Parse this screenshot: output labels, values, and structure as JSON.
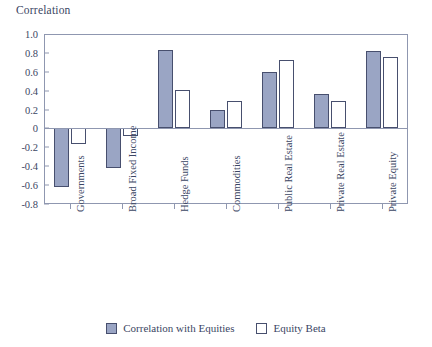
{
  "chart_data": {
    "type": "bar",
    "title": "Correlation",
    "xlabel": "",
    "ylabel": "Correlation",
    "ylim": [
      -0.8,
      1.0
    ],
    "ytick_values": [
      1.0,
      0.8,
      0.6,
      0.4,
      0.2,
      0,
      -0.2,
      -0.4,
      -0.6,
      -0.8
    ],
    "ytick_labels": [
      "1.0",
      "0.8",
      "0.6",
      "0.4",
      "0.2",
      "0",
      "-0.2",
      "-0.4",
      "-0.6",
      "-0.8"
    ],
    "grid": false,
    "legend_position": "bottom",
    "categories": [
      "Governments",
      "Broad Fixed Income",
      "Hedge Funds",
      "Commodities",
      "Public Real Estate",
      "Private Real Estate",
      "Private Equity"
    ],
    "series": [
      {
        "name": "Correlation with Equities",
        "style": "filled",
        "color": "#9aa5c4",
        "edge_color": "#474f6e",
        "values": [
          -0.62,
          -0.42,
          0.83,
          0.2,
          0.6,
          0.36,
          0.82
        ]
      },
      {
        "name": "Equity Beta",
        "style": "open",
        "color": "#ffffff",
        "edge_color": "#474f6e",
        "values": [
          -0.17,
          -0.08,
          0.41,
          0.29,
          0.73,
          0.29,
          0.76
        ]
      }
    ]
  },
  "colors": {
    "series_filled": "#9aa5c4",
    "series_open": "#ffffff",
    "edge": "#474f6e",
    "axis": "#8f97b0",
    "text": "#3b4663",
    "background": "#ffffff"
  }
}
